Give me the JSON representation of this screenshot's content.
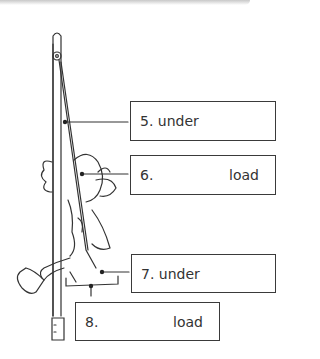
{
  "diagram": {
    "labels": [
      {
        "id": "5",
        "number": "5.",
        "word": "under",
        "layout": "inline"
      },
      {
        "id": "6",
        "number": "6.",
        "word": "load",
        "layout": "split"
      },
      {
        "id": "7",
        "number": "7.",
        "word": "under",
        "layout": "inline"
      },
      {
        "id": "8",
        "number": "8.",
        "word": "load",
        "layout": "split"
      }
    ]
  }
}
